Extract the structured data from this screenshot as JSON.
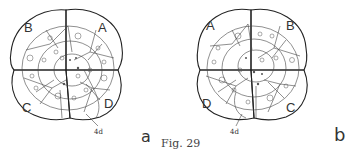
{
  "figure": {
    "caption": "Fig. 29",
    "panels": [
      {
        "id": "a",
        "letter": "a",
        "quadrants": {
          "top_left": "B",
          "top_right": "A",
          "bottom_left": "C",
          "bottom_right": "D"
        },
        "cell_label": "4d"
      },
      {
        "id": "b",
        "letter": "b",
        "quadrants": {
          "top_left": "A",
          "top_right": "B",
          "bottom_left": "D",
          "bottom_right": "C"
        },
        "cell_label": "4d"
      }
    ]
  }
}
